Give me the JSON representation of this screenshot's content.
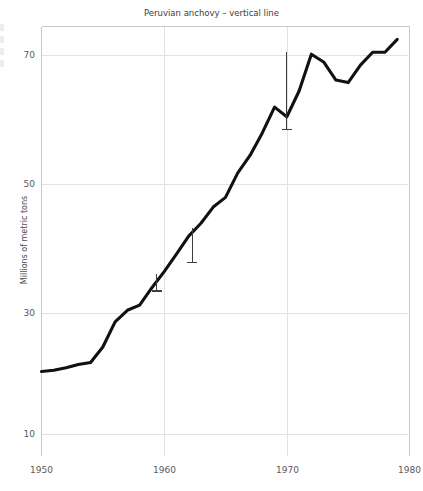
{
  "chart_data": {
    "type": "line",
    "title": "Peruvian anchovy – vertical line",
    "xlabel": "",
    "ylabel": "Millions of metric tons",
    "xlim": [
      1950,
      1980
    ],
    "ylim": [
      4,
      74
    ],
    "xticks": [
      1950,
      1960,
      1970,
      1980
    ],
    "xticklabels": [
      "1950",
      "1960",
      "1970",
      "1980"
    ],
    "yticks": [
      10,
      30,
      50,
      70
    ],
    "yticklabels": [
      "10",
      "30",
      "50",
      "70"
    ],
    "grid": true,
    "legend": "none",
    "x": [
      1950,
      1951,
      1952,
      1953,
      1954,
      1955,
      1956,
      1957,
      1958,
      1959,
      1960,
      1961,
      1962,
      1963,
      1964,
      1965,
      1966,
      1967,
      1968,
      1969,
      1970,
      1971,
      1972,
      1973,
      1974,
      1975,
      1976,
      1977,
      1978,
      1979
    ],
    "values": [
      21.0,
      21.2,
      21.6,
      22.1,
      22.4,
      24.8,
      28.7,
      30.5,
      31.3,
      34.0,
      36.5,
      39.2,
      42.0,
      44.0,
      46.5,
      48.0,
      51.8,
      54.5,
      58.0,
      62.0,
      60.5,
      64.5,
      70.2,
      69.0,
      66.2,
      65.8,
      68.5,
      70.5,
      70.5,
      72.5
    ],
    "series": [
      {
        "name": "Peruvian anchovy",
        "values": [
          21.0,
          21.2,
          21.6,
          22.1,
          22.4,
          24.8,
          28.7,
          30.5,
          31.3,
          34.0,
          36.5,
          39.2,
          42.0,
          44.0,
          46.5,
          48.0,
          51.8,
          54.5,
          58.0,
          62.0,
          60.5,
          64.5,
          70.2,
          69.0,
          66.2,
          65.8,
          68.5,
          70.5,
          70.5,
          72.5
        ]
      }
    ],
    "annotations": [
      {
        "type": "vertical-line",
        "x": 1959.4,
        "y_top": 36.1,
        "y_bottom": 33.5,
        "cap": "bottom"
      },
      {
        "type": "vertical-line",
        "x": 1962.3,
        "y_top": 43.3,
        "y_bottom": 37.9,
        "cap": "bottom"
      },
      {
        "type": "vertical-line",
        "x": 1970.0,
        "y_top": 70.6,
        "y_bottom": 58.5,
        "cap": "bottom"
      }
    ]
  }
}
